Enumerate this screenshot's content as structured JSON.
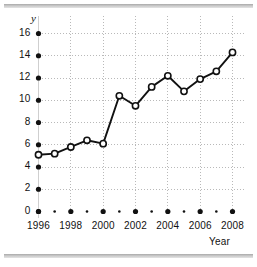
{
  "chart_data": {
    "type": "line",
    "title": "",
    "xlabel": "Year",
    "ylabel": "y",
    "x": [
      1996,
      1997,
      1998,
      1999,
      2000,
      2001,
      2002,
      2003,
      2004,
      2005,
      2006,
      2007,
      2008
    ],
    "values": [
      5.1,
      5.2,
      5.8,
      6.4,
      6.1,
      10.4,
      9.5,
      11.2,
      12.2,
      10.8,
      11.9,
      12.6,
      14.3
    ],
    "xlim": [
      1996,
      2008
    ],
    "ylim": [
      0,
      16
    ],
    "y_ticks": [
      0,
      2,
      4,
      6,
      8,
      10,
      12,
      14,
      16
    ],
    "y_tick_labels": [
      "0",
      "2",
      "4",
      "6",
      "8",
      "10",
      "12",
      "14",
      "16"
    ],
    "x_ticks": [
      1996,
      1998,
      2000,
      2002,
      2004,
      2006,
      2008
    ],
    "x_tick_labels": [
      "1996",
      "1998",
      "2000",
      "2002",
      "2004",
      "2006",
      "2008"
    ],
    "x_minor_ticks": [
      1997,
      1999,
      2001,
      2003,
      2005,
      2007
    ],
    "grid": true,
    "grid_style": "dotted",
    "legend": "none",
    "marker": "open-circle",
    "line_color": "#111111",
    "marker_fill": "#ffffff",
    "marker_edge": "#111111",
    "grid_color": "#b9b9b9",
    "axis_color": "#111111",
    "background": "#ffffff"
  },
  "decorations": {
    "top_rule": "",
    "bottom_rule": ""
  }
}
